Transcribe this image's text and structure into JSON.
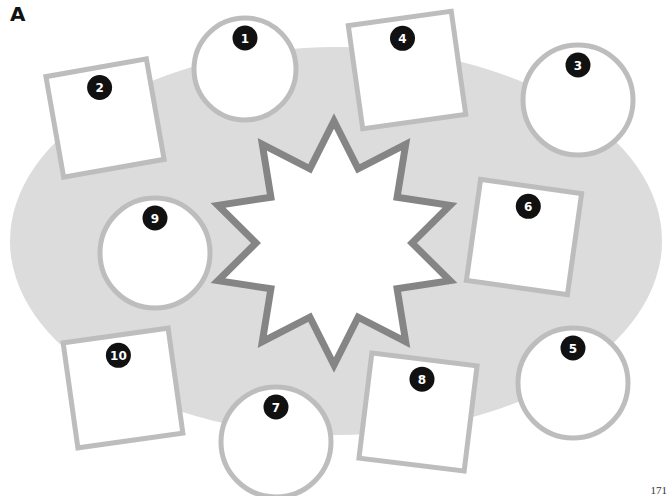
{
  "section_label": "A",
  "page_number": "171",
  "colors": {
    "ellipse_fill": "#dcdcdc",
    "shape_stroke": "#bdbdbd",
    "shape_fill": "#ffffff",
    "star_stroke": "#858585",
    "badge_fill": "#111111",
    "badge_text": "#ffffff"
  },
  "table_ellipse": {
    "cx": 336,
    "cy": 241,
    "rx": 326,
    "ry": 194
  },
  "center_star": {
    "cx": 334,
    "cy": 243,
    "points": 10,
    "outer_r": 122,
    "inner_r": 78
  },
  "seats": [
    {
      "number": "1",
      "shape": "circle",
      "cx": 245,
      "cy": 69,
      "r": 51
    },
    {
      "number": "2",
      "shape": "square",
      "cx": 105,
      "cy": 118,
      "size": 102,
      "rotate": -10
    },
    {
      "number": "3",
      "shape": "circle",
      "cx": 578,
      "cy": 100,
      "r": 55
    },
    {
      "number": "4",
      "shape": "square",
      "cx": 407,
      "cy": 70,
      "size": 104,
      "rotate": -8
    },
    {
      "number": "5",
      "shape": "circle",
      "cx": 573,
      "cy": 383,
      "r": 55
    },
    {
      "number": "6",
      "shape": "square",
      "cx": 524,
      "cy": 237,
      "size": 102,
      "rotate": 8
    },
    {
      "number": "7",
      "shape": "circle",
      "cx": 276,
      "cy": 442,
      "r": 55
    },
    {
      "number": "8",
      "shape": "square",
      "cx": 418,
      "cy": 412,
      "size": 106,
      "rotate": 7
    },
    {
      "number": "9",
      "shape": "circle",
      "cx": 155,
      "cy": 253,
      "r": 55
    },
    {
      "number": "10",
      "shape": "square",
      "cx": 123,
      "cy": 388,
      "size": 106,
      "rotate": -8
    }
  ]
}
